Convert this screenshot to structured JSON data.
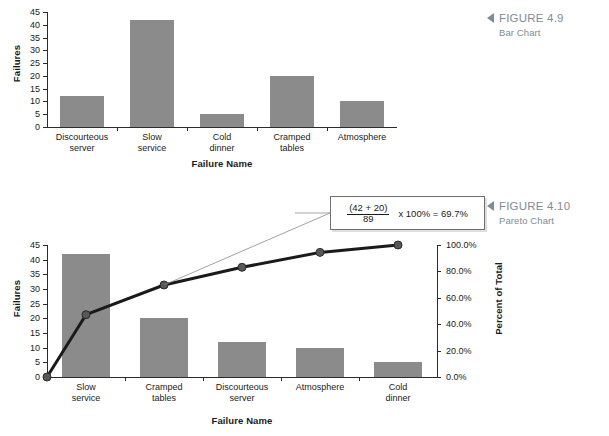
{
  "page": {
    "background": "#ffffff",
    "bar_color": "#8b8b8b",
    "line_color": "#1a1a1a",
    "caption_color": "#7f8c96"
  },
  "figures": [
    {
      "marker": "triangle-left",
      "title": "FIGURE 4.9",
      "subtitle": "Bar Chart"
    },
    {
      "marker": "triangle-left",
      "title": "FIGURE 4.10",
      "subtitle": "Pareto Chart"
    }
  ],
  "callout": {
    "numerator": "(42 + 20)",
    "denominator": "89",
    "result": "x 100% = 69.7%"
  },
  "chart_data": [
    {
      "type": "bar",
      "title": "Bar Chart",
      "figure": "FIGURE 4.9",
      "categories": [
        "Discourteous\nserver",
        "Slow\nservice",
        "Cold\ndinner",
        "Cramped\ntables",
        "Atmosphere"
      ],
      "values": [
        12,
        42,
        5,
        20,
        10
      ],
      "xlabel": "Failure Name",
      "ylabel": "Failures",
      "ylim": [
        0,
        45
      ],
      "yticks": [
        0,
        5,
        10,
        15,
        20,
        25,
        30,
        35,
        40,
        45
      ],
      "ytick_labels": [
        "0",
        "5",
        "10",
        "15",
        "20",
        "25",
        "30",
        "35",
        "40",
        "45"
      ],
      "grid": false,
      "legend": "none"
    },
    {
      "type": "bar",
      "title": "Pareto Chart",
      "figure": "FIGURE 4.10",
      "categories": [
        "Slow\nservice",
        "Cramped\ntables",
        "Discourteous\nserver",
        "Atmosphere",
        "Cold\ndinner"
      ],
      "values": [
        42,
        20,
        12,
        10,
        5
      ],
      "total": 89,
      "xlabel": "Failure Name",
      "ylabel": "Failures",
      "ylim": [
        0,
        45
      ],
      "yticks": [
        0,
        5,
        10,
        15,
        20,
        25,
        30,
        35,
        40,
        45
      ],
      "ytick_labels": [
        "0",
        "5",
        "10",
        "15",
        "20",
        "25",
        "30",
        "35",
        "40",
        "45"
      ],
      "y2label": "Percent of Total",
      "y2lim": [
        0,
        100
      ],
      "y2ticks": [
        0,
        20,
        40,
        60,
        80,
        100
      ],
      "y2tick_labels": [
        "0.0%",
        "20.0%",
        "40.0%",
        "60.0%",
        "80.0%",
        "100.0%"
      ],
      "series": [
        {
          "name": "Cumulative Percent",
          "type": "line",
          "values": [
            0,
            47.2,
            69.7,
            83.1,
            94.4,
            100.0
          ],
          "markers": true
        }
      ],
      "annotation": "(42 + 20) / 89 x 100% = 69.7%",
      "grid": false,
      "legend": "none"
    }
  ]
}
